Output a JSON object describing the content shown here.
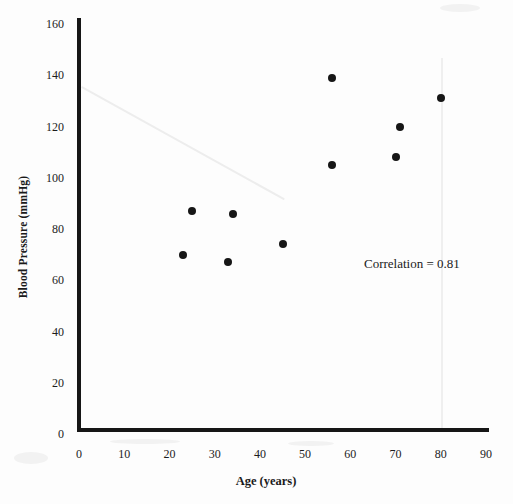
{
  "figure": {
    "y_axis_title": "Blood Pressure (mmHg)",
    "x_axis_title": "Age (years)",
    "annotation_text": "Correlation = 0.81"
  },
  "chart_data": {
    "type": "scatter",
    "title": "",
    "xlabel": "Age (years)",
    "ylabel": "Blood Pressure (mmHg)",
    "xlim": [
      0,
      90
    ],
    "ylim": [
      0,
      160
    ],
    "x_ticks": [
      0,
      10,
      20,
      30,
      40,
      50,
      60,
      70,
      80,
      90
    ],
    "y_ticks": [
      0,
      20,
      40,
      60,
      80,
      100,
      120,
      140,
      160
    ],
    "grid": false,
    "legend": "none",
    "annotations": [
      {
        "text": "Correlation = 0.81",
        "x": 63,
        "y": 67
      }
    ],
    "series": [
      {
        "name": "patients",
        "points": [
          [
            23,
            70
          ],
          [
            25,
            87
          ],
          [
            33,
            67
          ],
          [
            34,
            86
          ],
          [
            45,
            74
          ],
          [
            56,
            105
          ],
          [
            56,
            139
          ],
          [
            70,
            108
          ],
          [
            71,
            120
          ],
          [
            80,
            131
          ]
        ]
      }
    ],
    "correlation": 0.81
  },
  "colors": {
    "ink": "#1a1a1a",
    "marker": "#161616",
    "paper": "#fdfdfd",
    "artifact": "#ededed"
  }
}
